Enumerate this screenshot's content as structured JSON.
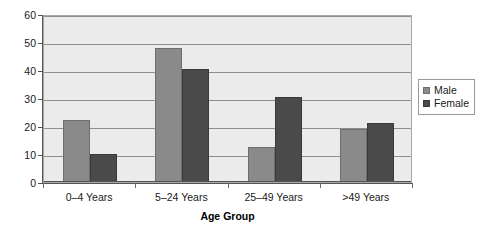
{
  "chart_data": {
    "type": "bar",
    "title": "",
    "xlabel": "Age Group",
    "ylabel": "",
    "categories": [
      "0–4 Years",
      "5–24 Years",
      "25–49 Years",
      ">49 Years"
    ],
    "series": [
      {
        "name": "Male",
        "values": [
          22,
          48,
          12.5,
          19
        ],
        "color": "#8a8a8a"
      },
      {
        "name": "Female",
        "values": [
          10,
          40.5,
          30.5,
          21
        ],
        "color": "#4a4a4a"
      }
    ],
    "ylim": [
      0,
      60
    ],
    "yticks": [
      0,
      10,
      20,
      30,
      40,
      50,
      60
    ],
    "ytick_labels": [
      "0",
      "10",
      "20",
      "30",
      "40",
      "50",
      "60"
    ],
    "grid": true,
    "grid_axis": "y",
    "legend_position": "right",
    "plot_background": "#ebebeb",
    "page_background": "#ffffff"
  },
  "legend": {
    "entries": [
      {
        "label": "Male",
        "swatch": "legend-swatch-male"
      },
      {
        "label": "Female",
        "swatch": "legend-swatch-female"
      }
    ]
  }
}
